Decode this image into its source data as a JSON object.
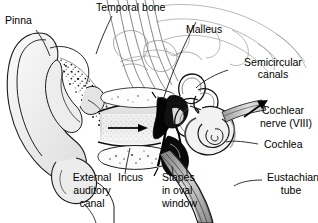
{
  "figure": {
    "type": "labeled-anatomical-line-drawing",
    "background_color": "#ffffff",
    "ink_color": "#000000",
    "label_color": "#000000"
  },
  "labels": {
    "pinna": "Pinna",
    "temporal_bone": "Temporal bone",
    "malleus": "Malleus",
    "semicircular_canals_l1": "Semicircular",
    "semicircular_canals_l2": "canals",
    "cochlear_nerve_l1": "Cochlear",
    "cochlear_nerve_l2": "nerve (VIII)",
    "cochlea": "Cochlea",
    "eustachian_tube_l1": "Eustachian",
    "eustachian_tube_l2": "tube",
    "stapes_l1": "Stapes",
    "stapes_l2": "in oval",
    "stapes_l3": "window",
    "incus": "Incus",
    "external_auditory_canal_l1": "External",
    "external_auditory_canal_l2": "auditory",
    "external_auditory_canal_l3": "canal"
  }
}
